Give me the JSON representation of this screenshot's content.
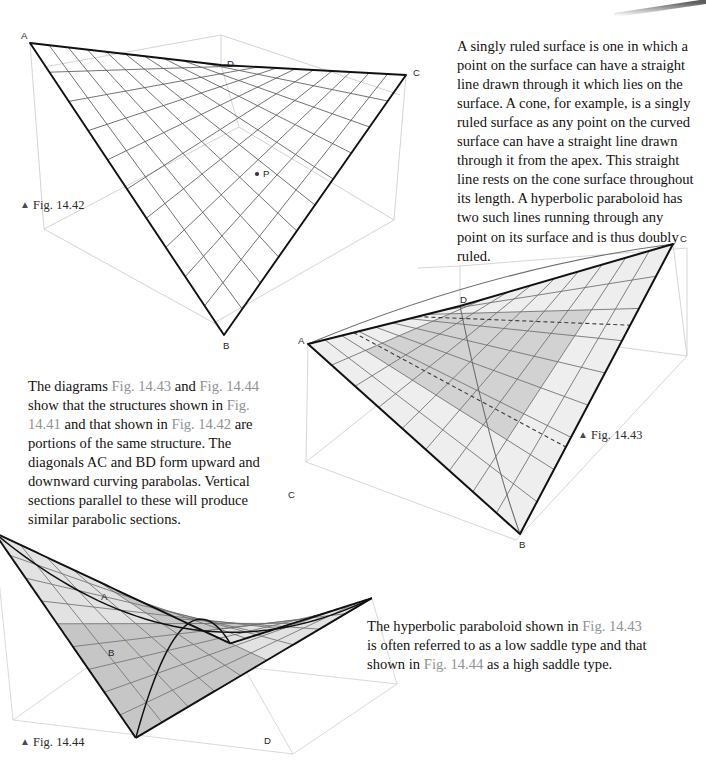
{
  "page": {
    "width": 706,
    "height": 762,
    "background": "#ffffff",
    "text_color": "#14120f",
    "figref_color": "#8e9295"
  },
  "paragraphs": {
    "intro": {
      "id": "para-intro",
      "runs": [
        {
          "text": "A singly ruled surface is one in which a point on the surface can have a straight line drawn through it which lies on the surface. A cone, for example, is a singly ruled surface as any point on the curved surface can have a straight line drawn through it from the apex. This straight line rests on the cone surface throughout its length. A hyperbolic paraboloid has two such lines running through any point on its surface and is thus doubly ruled.",
          "style": "normal"
        }
      ],
      "plain": "A singly ruled surface is one in which a point on the surface can have a straight line drawn through it which lies on the surface. A cone, for example, is a singly ruled surface as any point on the curved surface can have a straight line drawn through it from the apex. This straight line rests on the cone surface throughout its length. A hyperbolic paraboloid has two such lines running through any point on its surface and is thus doubly ruled."
    },
    "middle": {
      "id": "para-middle",
      "runs": [
        {
          "text": "The diagrams ",
          "style": "normal"
        },
        {
          "text": "Fig. 14.43",
          "style": "figref"
        },
        {
          "text": " and ",
          "style": "normal"
        },
        {
          "text": "Fig. 14.44",
          "style": "figref"
        },
        {
          "text": " show that the structures shown in ",
          "style": "normal"
        },
        {
          "text": "Fig. 14.41",
          "style": "figref"
        },
        {
          "text": " and that shown in ",
          "style": "normal"
        },
        {
          "text": "Fig. 14.42",
          "style": "figref"
        },
        {
          "text": " are portions of the same structure. The diagonals AC and BD form upward and downward curving parabolas. Vertical sections parallel to these will produce similar parabolic sections.",
          "style": "normal"
        }
      ],
      "plain": "The diagrams Fig. 14.43 and Fig. 14.44 show that the structures shown in Fig. 14.41 and that shown in Fig. 14.42 are portions of the same structure. The diagonals AC and BD form upward and downward curving parabolas. Vertical sections parallel to these will produce similar parabolic sections."
    },
    "bottom": {
      "id": "para-bottom",
      "runs": [
        {
          "text": "The hyperbolic paraboloid shown in ",
          "style": "normal"
        },
        {
          "text": "Fig. 14.43",
          "style": "figref"
        },
        {
          "text": " is often referred to as a low saddle type and that shown in ",
          "style": "normal"
        },
        {
          "text": "Fig. 14.44",
          "style": "figref"
        },
        {
          "text": " as a high saddle type.",
          "style": "normal"
        }
      ],
      "plain": "The hyperbolic paraboloid shown in Fig. 14.43 is often referred to as a low saddle type and that shown in Fig. 14.44 as a high saddle type."
    }
  },
  "captions": {
    "fig1442": {
      "caret": "▲",
      "label": "Fig. 14.42"
    },
    "fig1443": {
      "caret": "▲",
      "label": "Fig. 14.43"
    },
    "fig1444": {
      "caret": "▲",
      "label": "Fig. 14.44"
    }
  },
  "figures": {
    "fig1442": {
      "name": "hyperbolic-paraboloid-wireframe",
      "title": "Fig. 14.42",
      "description": "Doubly ruled hyperbolic paraboloid shown as an open wireframe quadrilateral ABCD with a marked surface point P.",
      "vertex_labels": [
        "A",
        "B",
        "C",
        "D",
        "P"
      ],
      "vertices": {
        "A": {
          "x": 22,
          "y": 25,
          "label_dx": -9,
          "label_dy": -4
        },
        "B": {
          "x": 216,
          "y": 317,
          "label_dx": -1,
          "label_dy": 14
        },
        "C": {
          "x": 398,
          "y": 57,
          "label_dx": 7,
          "label_dy": 1
        },
        "D": {
          "x": 213,
          "y": 47,
          "label_dx": 6,
          "label_dy": 2
        },
        "P": {
          "x": 249,
          "y": 156,
          "label_dx": 6,
          "label_dy": 3
        }
      },
      "grid_divisions": 10,
      "stroke_edge": "#111111",
      "stroke_rule": "#5a5a5a",
      "stroke_box": "#c9c9c9",
      "fill": "none"
    },
    "fig1443": {
      "name": "hyperbolic-paraboloid-low-saddle",
      "title": "Fig. 14.43",
      "description": "Shaded low saddle hyperbolic paraboloid ABCD with an inner shaded panel and dashed section edges.",
      "vertex_labels": [
        "A",
        "B",
        "C",
        "D"
      ],
      "vertices": {
        "A": {
          "x": 20,
          "y": 116,
          "label_dx": -10,
          "label_dy": 0
        },
        "B": {
          "x": 232,
          "y": 306,
          "label_dx": -1,
          "label_dy": 14
        },
        "C": {
          "x": 385,
          "y": 16,
          "label_dx": 7,
          "label_dy": -2
        },
        "D": {
          "x": 172,
          "y": 78,
          "label_dx": 0,
          "label_dy": -3
        }
      },
      "grid_divisions": 9,
      "stroke_edge": "#111111",
      "stroke_rule": "#6b6b6b",
      "stroke_box": "#cccccc",
      "fill_light": "#eeeeee",
      "fill_mid": "#d2d2d2",
      "saddle_type": "low"
    },
    "fig1444": {
      "name": "hyperbolic-paraboloid-high-saddle",
      "title": "Fig. 14.44",
      "description": "Shaded high saddle hyperbolic paraboloid ABCD with a deeply curved surface.",
      "vertex_labels": [
        "A",
        "B",
        "C",
        "D"
      ],
      "vertices": {
        "A": {
          "x": 95,
          "y": 128,
          "label_dx": -2,
          "label_dy": -6
        },
        "B": {
          "x": 110,
          "y": 172,
          "label_dx": -10,
          "label_dy": 6
        },
        "C": {
          "x": 276,
          "y": 23,
          "label_dx": 4,
          "label_dy": -3
        },
        "D": {
          "x": 252,
          "y": 254,
          "label_dx": 4,
          "label_dy": 12
        }
      },
      "grid_divisions": 9,
      "stroke_edge": "#111111",
      "stroke_rule": "#6f6f6f",
      "stroke_box": "#cfcfcf",
      "fill_light": "#e2e2e2",
      "fill_mid": "#c6c6c6",
      "saddle_type": "high"
    }
  }
}
